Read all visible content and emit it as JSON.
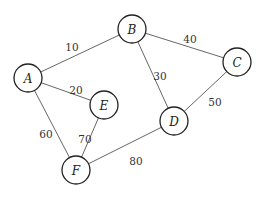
{
  "graph": {
    "nodes": [
      {
        "id": "A",
        "label": "A",
        "x": 28,
        "y": 78
      },
      {
        "id": "B",
        "label": "B",
        "x": 132,
        "y": 29
      },
      {
        "id": "C",
        "label": "C",
        "x": 237,
        "y": 62
      },
      {
        "id": "D",
        "label": "D",
        "x": 174,
        "y": 121
      },
      {
        "id": "E",
        "label": "E",
        "x": 104,
        "y": 105
      },
      {
        "id": "F",
        "label": "F",
        "x": 76,
        "y": 170
      }
    ],
    "edges": [
      {
        "from": "A",
        "to": "B",
        "weight": "10",
        "lx": 72,
        "ly": 48
      },
      {
        "from": "A",
        "to": "E",
        "weight": "20",
        "lx": 76,
        "ly": 91
      },
      {
        "from": "B",
        "to": "C",
        "weight": "40",
        "lx": 190,
        "ly": 40
      },
      {
        "from": "B",
        "to": "D",
        "weight": "30",
        "lx": 160,
        "ly": 77
      },
      {
        "from": "C",
        "to": "D",
        "weight": "50",
        "lx": 215,
        "ly": 103
      },
      {
        "from": "A",
        "to": "F",
        "weight": "60",
        "lx": 46,
        "ly": 135
      },
      {
        "from": "E",
        "to": "F",
        "weight": "70",
        "lx": 85,
        "ly": 140
      },
      {
        "from": "D",
        "to": "F",
        "weight": "80",
        "lx": 136,
        "ly": 162
      }
    ]
  }
}
